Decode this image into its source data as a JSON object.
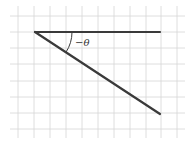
{
  "diagram": {
    "type": "angle-diagram",
    "background": "#ffffff",
    "grid": {
      "color": "#d6d6d6",
      "x_lines": [
        18,
        34,
        50,
        66,
        82,
        98,
        114,
        130,
        146,
        161,
        177
      ],
      "y_lines": [
        16,
        32,
        48,
        64,
        81,
        97,
        113,
        129
      ]
    },
    "vertex": {
      "x": 35,
      "y": 32
    },
    "initial_ray_end": {
      "x": 160,
      "y": 32
    },
    "terminal_ray_end": {
      "x": 160,
      "y": 114
    },
    "ray_color": "#3a3a3a",
    "angle_label": "−θ"
  }
}
